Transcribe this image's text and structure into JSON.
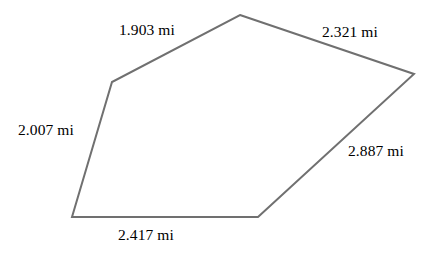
{
  "figure": {
    "type": "polygon-diagram",
    "shape_name": "pentagon",
    "units": "mi",
    "stroke_color": "#707070",
    "text_color": "#000000",
    "background_color": "#ffffff",
    "stroke_width": 2,
    "vertices": [
      {
        "name": "top-apex",
        "x": 240,
        "y": 15
      },
      {
        "name": "right",
        "x": 414,
        "y": 74
      },
      {
        "name": "bottom-right",
        "x": 258,
        "y": 217
      },
      {
        "name": "bottom-left",
        "x": 72,
        "y": 217
      },
      {
        "name": "left-upper",
        "x": 112,
        "y": 82
      }
    ],
    "path": "M 240 15 L 414 74 L 258 217 L 72 217 L 112 82 Z",
    "edges": [
      {
        "id": "top-left",
        "from": "left-upper",
        "to": "top-apex",
        "label": "1.903 mi",
        "value": 1.903
      },
      {
        "id": "top-right",
        "from": "top-apex",
        "to": "right",
        "label": "2.321 mi",
        "value": 2.321
      },
      {
        "id": "right",
        "from": "right",
        "to": "bottom-right",
        "label": "2.887 mi",
        "value": 2.887
      },
      {
        "id": "bottom",
        "from": "bottom-right",
        "to": "bottom-left",
        "label": "2.417 mi",
        "value": 2.417
      },
      {
        "id": "left",
        "from": "bottom-left",
        "to": "left-upper",
        "label": "2.007 mi",
        "value": 2.007
      }
    ],
    "labels": {
      "top_left": "1.903 mi",
      "top_right": "2.321 mi",
      "left": "2.007 mi",
      "right": "2.887 mi",
      "bottom": "2.417 mi"
    }
  }
}
